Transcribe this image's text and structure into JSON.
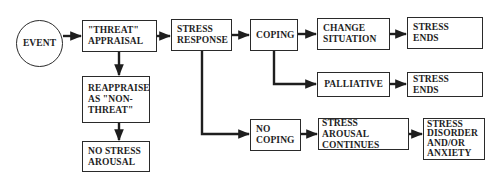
{
  "diagram": {
    "type": "flowchart",
    "title": "",
    "nodes": {
      "event": "EVENT",
      "threat_appraisal": "\"THREAT\"\nAPPRAISAL",
      "reappraise": "REAPPRAISE\nAS \"NON-\nTHREAT\"",
      "no_stress_arousal": "NO STRESS\nAROUSAL",
      "stress_response": "STRESS\nRESPONSE",
      "coping": "COPING",
      "change_situation": "CHANGE\nSITUATION",
      "stress_ends_1": "STRESS ENDS",
      "palliative": "PALLIATIVE",
      "stress_ends_2": "STRESS ENDS",
      "no_coping": "NO\nCOPING",
      "stress_arousal_continues": "STRESS AROUSAL\nCONTINUES",
      "stress_disorder": "STRESS\nDISORDER\nAND/OR\nANXIETY"
    },
    "edges": [
      [
        "event",
        "threat_appraisal"
      ],
      [
        "threat_appraisal",
        "stress_response"
      ],
      [
        "threat_appraisal",
        "reappraise"
      ],
      [
        "reappraise",
        "no_stress_arousal"
      ],
      [
        "stress_response",
        "coping"
      ],
      [
        "stress_response",
        "no_coping"
      ],
      [
        "coping",
        "change_situation"
      ],
      [
        "coping",
        "palliative"
      ],
      [
        "change_situation",
        "stress_ends_1"
      ],
      [
        "palliative",
        "stress_ends_2"
      ],
      [
        "no_coping",
        "stress_arousal_continues"
      ],
      [
        "stress_arousal_continues",
        "stress_disorder"
      ]
    ],
    "colors": {
      "line": "#1e1e1e",
      "background": "#ffffff"
    }
  }
}
